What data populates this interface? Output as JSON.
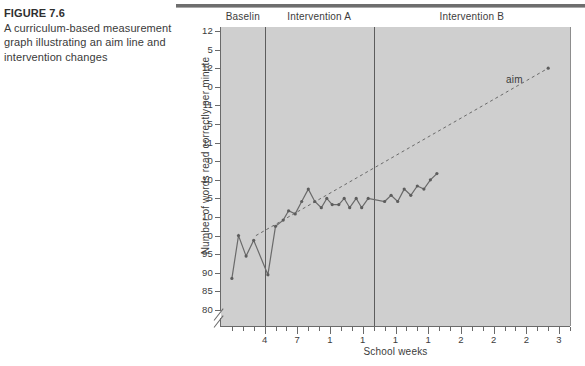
{
  "caption": {
    "figure_label": "FIGURE 7.6",
    "description": "A curriculum-based measurement graph illustrating an aim line and intervention changes"
  },
  "chart_data": {
    "type": "line",
    "title": "",
    "xlabel": "School weeks",
    "ylabel": "Number of words read correctly per minute",
    "grid": false,
    "legend": "none",
    "axis_break": true,
    "xlim": [
      0,
      32
    ],
    "ylim": [
      80,
      130
    ],
    "y_tick_labels": [
      "12",
      "5",
      "12",
      "0",
      "11",
      "5",
      "11",
      "0",
      "10",
      "5",
      "10",
      "0",
      "95",
      "90",
      "85",
      "80"
    ],
    "y_tick_values": [
      130,
      127,
      124,
      121,
      118,
      115,
      112,
      109,
      106,
      103,
      100,
      97,
      95,
      90,
      85,
      80
    ],
    "x_tick_labels": [
      "4",
      "7",
      "1",
      "1",
      "1",
      "1",
      "2",
      "2",
      "2",
      "3"
    ],
    "x_tick_values": [
      4,
      7,
      10,
      13,
      16,
      19,
      22,
      25,
      28,
      31
    ],
    "phases": [
      {
        "name": "Baselin",
        "start": 0,
        "end": 4
      },
      {
        "name": "Intervention A",
        "start": 4,
        "end": 14
      },
      {
        "name": "Intervention B",
        "start": 14,
        "end": 32
      }
    ],
    "annotations": [
      {
        "text": "aim",
        "x": 28.5,
        "y": 123
      }
    ],
    "series": [
      {
        "name": "words read correctly per minute",
        "style": "solid-with-markers",
        "x": [
          1.0,
          1.6,
          2.3,
          3.0,
          4.3,
          5.0,
          5.7,
          6.2,
          6.8,
          7.4,
          8.0,
          8.6,
          9.2,
          9.7,
          10.2,
          10.8,
          11.3,
          11.8,
          12.4,
          12.9,
          13.5,
          15.0,
          15.6,
          16.2,
          16.8,
          17.4,
          18.0,
          18.6,
          19.2,
          19.8
        ],
        "y": [
          88.5,
          97.0,
          94.5,
          96.5,
          89.5,
          98.5,
          99.5,
          101.0,
          100.5,
          102.5,
          104.5,
          102.5,
          101.5,
          103.0,
          102.0,
          102.0,
          103.0,
          101.5,
          103.0,
          101.5,
          103.0,
          102.5,
          103.5,
          102.5,
          104.5,
          103.5,
          105.0,
          104.5,
          106.0,
          107.0
        ]
      },
      {
        "name": "aim line",
        "style": "dashed",
        "x": [
          3.2,
          30.0
        ],
        "y": [
          97.0,
          124.0
        ]
      }
    ]
  }
}
